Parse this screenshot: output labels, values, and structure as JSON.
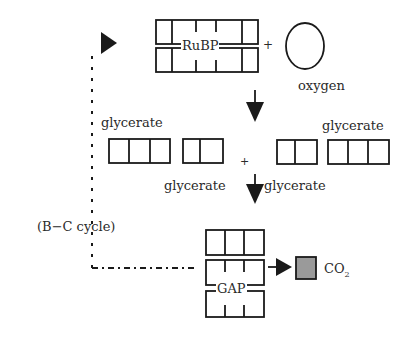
{
  "diagram": {
    "molecules": {
      "rubp": "RuBP",
      "oxygen": "oxygen",
      "glycerate_left_top": "glycerate",
      "glycerate_right_top": "glycerate",
      "glycerate_left_bottom": "glycerate",
      "glycerate_right_bottom": "glycerate",
      "gap": "GAP",
      "co2": "CO",
      "co2_sub": "2"
    },
    "operators": {
      "plus_top": "+",
      "plus_middle": "+"
    },
    "cycle_label": "(B−C cycle)",
    "colors": {
      "line": "#1a1a1a",
      "co2_fill": "#9a9a9a"
    }
  }
}
